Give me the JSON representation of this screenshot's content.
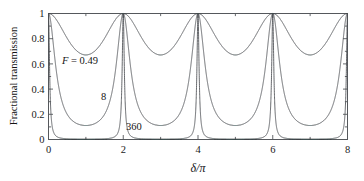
{
  "chart_data": {
    "type": "line",
    "title": "",
    "subtitle": "",
    "xlabel": "δ/π",
    "ylabel": "Fractional transmission",
    "xlim": [
      0,
      8
    ],
    "ylim": [
      0,
      1
    ],
    "xticks": [
      0,
      2,
      4,
      6,
      8
    ],
    "xticklabels": [
      "0",
      "2",
      "4",
      "6",
      "8"
    ],
    "xminorticks": [
      1,
      3,
      5,
      7
    ],
    "yticks": [
      0,
      0.2,
      0.4,
      0.6,
      0.8,
      1
    ],
    "yticklabels": [
      "0",
      "0.2",
      "0.4",
      "0.6",
      "0.8",
      "1"
    ],
    "yminorticks": [
      0.1,
      0.3,
      0.5,
      0.7,
      0.9
    ],
    "grid": false,
    "legend_position": "inline-annotations",
    "formula": "T = 1 / (1 + F sin^2(delta/2))",
    "series": [
      {
        "name": "F = 0.49",
        "finesse_coefficient": 0.49,
        "minimum_value": 0.671,
        "maximum_value": 1.0,
        "color": "#4a4d51",
        "label": "F = 0.49",
        "label_x": 1.05,
        "label_y": 0.63
      },
      {
        "name": "8",
        "finesse_coefficient": 8,
        "minimum_value": 0.111,
        "maximum_value": 1.0,
        "color": "#4a4d51",
        "label": "8",
        "label_x": 1.65,
        "label_y": 0.3
      },
      {
        "name": "360",
        "finesse_coefficient": 360,
        "minimum_value": 0.00277,
        "maximum_value": 1.0,
        "color": "#4a4d51",
        "label": "360",
        "label_x": 2.28,
        "label_y": 0.075
      }
    ],
    "peaks_at": [
      0,
      2,
      4,
      6,
      8
    ],
    "minima_at": [
      1,
      3,
      5,
      7
    ]
  },
  "axes": {
    "x_label_text": "δ/π",
    "y_label_text": "Fractional transmission"
  },
  "annotations": {
    "label_f049_italic": "F",
    "label_f049_rest": " = 0.49",
    "label_8": "8",
    "label_360": "360"
  },
  "ticklabels": {
    "x": [
      "0",
      "2",
      "4",
      "6",
      "8"
    ],
    "y": [
      "1",
      "0.8",
      "0.6",
      "0.4",
      "0.2",
      "0"
    ]
  },
  "colors": {
    "curve": "#4a4d51",
    "axis": "#55585c",
    "background": "#ffffff",
    "text": "#141414"
  }
}
